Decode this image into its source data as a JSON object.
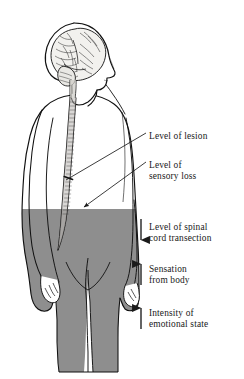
{
  "figure": {
    "top_faint_text": "",
    "colors": {
      "ink": "#1a1a1a",
      "outline": "#111111",
      "shaded_body": "#8e8e8e",
      "paper": "#ffffff",
      "brain_fill": "#f2f1ee",
      "cord_fill": "#b9b7b2"
    }
  },
  "annotations": [
    {
      "id": "lesion",
      "label": "Level of lesion",
      "marker": "leader-line",
      "target": "spinal-cord-lesion-point"
    },
    {
      "id": "sensory",
      "label": "Level of\nsensory loss",
      "marker": "leader-line-arrow",
      "target": "shaded-region-boundary"
    },
    {
      "id": "transection",
      "label": "Level of spinal\ncord transection",
      "marker": "arrow-down",
      "direction": "down"
    },
    {
      "id": "sensation",
      "label": "Sensation\nfrom body",
      "marker": "arrow-up",
      "direction": "up"
    },
    {
      "id": "emotional",
      "label": "Intensity of\nemotional state",
      "marker": "arrow-up",
      "direction": "up"
    }
  ],
  "anatomy": {
    "head": "head-profile-right-facing",
    "brain": "cerebrum-with-sulci",
    "brainstem": "brainstem",
    "spinal_cord": "segmented-spinal-cord",
    "body": "standing-human-figure",
    "shaded_lower_body": "region-of-sensory-loss"
  }
}
